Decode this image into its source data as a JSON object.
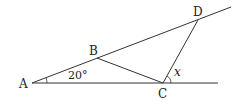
{
  "diagram": {
    "points": {
      "A": "A",
      "B": "B",
      "C": "C",
      "D": "D"
    },
    "angle_label": "20°",
    "unknown_label": "x"
  }
}
